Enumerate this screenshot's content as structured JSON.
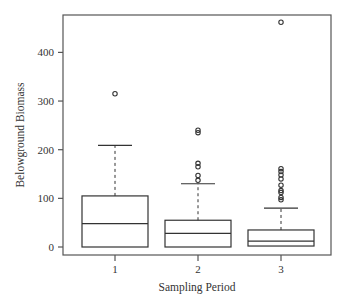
{
  "chart_data": {
    "type": "boxplot",
    "title": "",
    "xlabel": "Sampling Period",
    "ylabel": "Belowground Biomass",
    "categories": [
      "1",
      "2",
      "3"
    ],
    "yticks": [
      0,
      100,
      200,
      300,
      400
    ],
    "ylim": [
      -15,
      480
    ],
    "grid": false,
    "legend": null,
    "series": [
      {
        "name": "1",
        "whisker_low": 0,
        "q1": 0,
        "median": 48,
        "q3": 105,
        "whisker_high": 209,
        "outliers": [
          315
        ]
      },
      {
        "name": "2",
        "whisker_low": 0,
        "q1": 0,
        "median": 28,
        "q3": 55,
        "whisker_high": 130,
        "outliers": [
          137,
          147,
          165,
          172,
          235,
          240
        ]
      },
      {
        "name": "3",
        "whisker_low": 0,
        "q1": 2,
        "median": 12,
        "q3": 35,
        "whisker_high": 80,
        "outliers": [
          97,
          102,
          112,
          116,
          127,
          140,
          148,
          155,
          161,
          462
        ]
      }
    ]
  },
  "labels": {
    "xlabel": "Sampling Period",
    "ylabel": "Belowground Biomass",
    "yticks": [
      "0",
      "100",
      "200",
      "300",
      "400"
    ],
    "xticks": [
      "1",
      "2",
      "3"
    ]
  },
  "colors": {
    "axis": "#555555",
    "box": "#333333",
    "background": "#ffffff"
  }
}
